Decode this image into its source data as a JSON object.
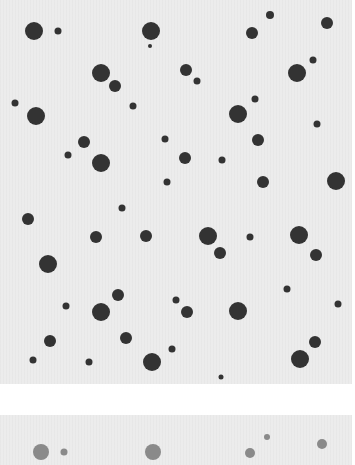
{
  "colors": {
    "panel_bg": "#ececec",
    "page_bg": "#ffffff",
    "dot_dark": "#333333",
    "dot_faded": "#8a8a8a"
  },
  "top_panel": {
    "dots": [
      {
        "x": 34,
        "y": 31,
        "r": 9
      },
      {
        "x": 58,
        "y": 31,
        "r": 3.5
      },
      {
        "x": 151,
        "y": 31,
        "r": 9
      },
      {
        "x": 150,
        "y": 46,
        "r": 2
      },
      {
        "x": 270,
        "y": 15,
        "r": 4
      },
      {
        "x": 327,
        "y": 23,
        "r": 6
      },
      {
        "x": 252,
        "y": 33,
        "r": 6
      },
      {
        "x": 101,
        "y": 73,
        "r": 9
      },
      {
        "x": 115,
        "y": 86,
        "r": 6
      },
      {
        "x": 186,
        "y": 70,
        "r": 6
      },
      {
        "x": 197,
        "y": 81,
        "r": 3.5
      },
      {
        "x": 313,
        "y": 60,
        "r": 3.5
      },
      {
        "x": 297,
        "y": 73,
        "r": 9
      },
      {
        "x": 15,
        "y": 103,
        "r": 3.5
      },
      {
        "x": 36,
        "y": 116,
        "r": 9
      },
      {
        "x": 133,
        "y": 106,
        "r": 3.5
      },
      {
        "x": 255,
        "y": 99,
        "r": 3.5
      },
      {
        "x": 238,
        "y": 114,
        "r": 9
      },
      {
        "x": 317,
        "y": 124,
        "r": 3.5
      },
      {
        "x": 84,
        "y": 142,
        "r": 6
      },
      {
        "x": 68,
        "y": 155,
        "r": 3.5
      },
      {
        "x": 101,
        "y": 163,
        "r": 9
      },
      {
        "x": 165,
        "y": 139,
        "r": 3.5
      },
      {
        "x": 185,
        "y": 158,
        "r": 6
      },
      {
        "x": 222,
        "y": 160,
        "r": 3.5
      },
      {
        "x": 258,
        "y": 140,
        "r": 6
      },
      {
        "x": 167,
        "y": 182,
        "r": 3.5
      },
      {
        "x": 263,
        "y": 182,
        "r": 6
      },
      {
        "x": 336,
        "y": 181,
        "r": 9
      },
      {
        "x": 28,
        "y": 219,
        "r": 6
      },
      {
        "x": 122,
        "y": 208,
        "r": 3.5
      },
      {
        "x": 96,
        "y": 237,
        "r": 6
      },
      {
        "x": 146,
        "y": 236,
        "r": 6
      },
      {
        "x": 208,
        "y": 236,
        "r": 9
      },
      {
        "x": 220,
        "y": 253,
        "r": 6
      },
      {
        "x": 250,
        "y": 237,
        "r": 3.5
      },
      {
        "x": 299,
        "y": 235,
        "r": 9
      },
      {
        "x": 316,
        "y": 255,
        "r": 6
      },
      {
        "x": 48,
        "y": 264,
        "r": 9
      },
      {
        "x": 176,
        "y": 300,
        "r": 3.5
      },
      {
        "x": 187,
        "y": 312,
        "r": 6
      },
      {
        "x": 66,
        "y": 306,
        "r": 3.5
      },
      {
        "x": 101,
        "y": 312,
        "r": 9
      },
      {
        "x": 118,
        "y": 295,
        "r": 6
      },
      {
        "x": 287,
        "y": 289,
        "r": 3.5
      },
      {
        "x": 238,
        "y": 311,
        "r": 9
      },
      {
        "x": 338,
        "y": 304,
        "r": 3.5
      },
      {
        "x": 50,
        "y": 341,
        "r": 6
      },
      {
        "x": 126,
        "y": 338,
        "r": 6
      },
      {
        "x": 172,
        "y": 349,
        "r": 3.5
      },
      {
        "x": 315,
        "y": 342,
        "r": 6
      },
      {
        "x": 33,
        "y": 360,
        "r": 3.5
      },
      {
        "x": 89,
        "y": 362,
        "r": 3.5
      },
      {
        "x": 152,
        "y": 362,
        "r": 9
      },
      {
        "x": 300,
        "y": 359,
        "r": 9
      },
      {
        "x": 221,
        "y": 377,
        "r": 2.5
      }
    ]
  },
  "bottom_panel": {
    "dots": [
      {
        "x": 41,
        "y": 37,
        "r": 8
      },
      {
        "x": 64,
        "y": 37,
        "r": 3.5
      },
      {
        "x": 153,
        "y": 37,
        "r": 8
      },
      {
        "x": 267,
        "y": 22,
        "r": 3
      },
      {
        "x": 250,
        "y": 38,
        "r": 5
      },
      {
        "x": 322,
        "y": 29,
        "r": 5
      }
    ]
  }
}
